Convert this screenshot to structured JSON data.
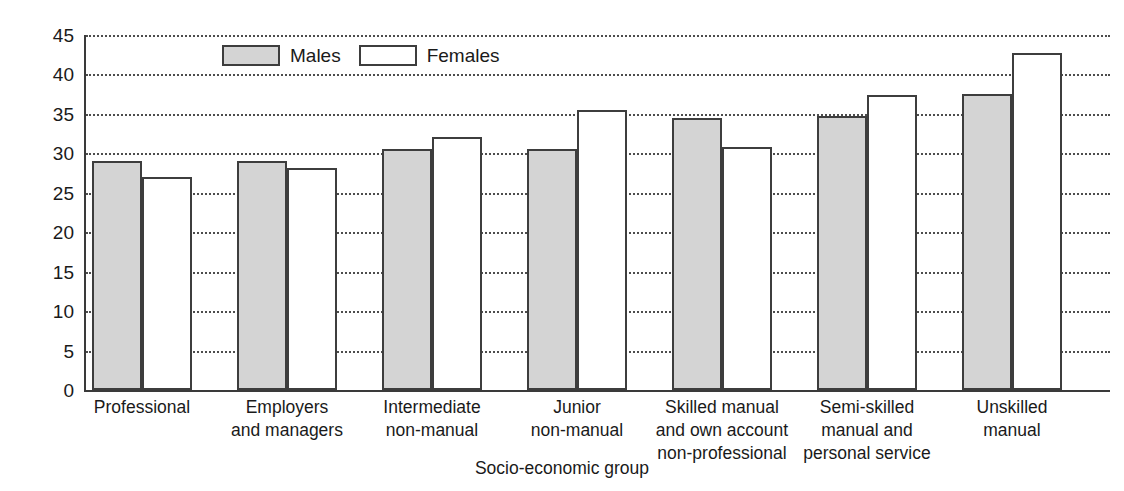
{
  "chart_data": {
    "type": "bar",
    "title": "",
    "xlabel": "Socio-economic group",
    "ylabel": "percentage",
    "ylim": [
      0,
      45
    ],
    "ytick_step": 5,
    "yticks": [
      0,
      5,
      10,
      15,
      20,
      25,
      30,
      35,
      40,
      45
    ],
    "grid": true,
    "grid_style": "dotted-horizontal",
    "legend_position": "top-left-inside",
    "categories": [
      "Professional",
      "Employers\nand managers",
      "Intermediate\nnon-manual",
      "Junior\nnon-manual",
      "Skilled manual\nand own account\nnon-professional",
      "Semi-skilled\nmanual and\npersonal service",
      "Unskilled\nmanual"
    ],
    "series": [
      {
        "name": "Males",
        "color": "#d4d4d4",
        "values": [
          29.0,
          29.0,
          30.5,
          30.5,
          34.5,
          34.7,
          37.5
        ]
      },
      {
        "name": "Females",
        "color": "#ffffff",
        "values": [
          27.0,
          28.2,
          32.1,
          35.5,
          30.8,
          37.4,
          42.7
        ]
      }
    ]
  },
  "legend": {
    "items": [
      {
        "label": "Males",
        "swatch": "males"
      },
      {
        "label": "Females",
        "swatch": "females"
      }
    ]
  },
  "axes": {
    "y_title": "percentage",
    "x_title": "Socio-economic group"
  }
}
